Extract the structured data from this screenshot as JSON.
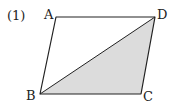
{
  "problem_label": "(1)",
  "figure": {
    "shape": "parallelogram",
    "vertices": {
      "A": {
        "label": "A",
        "x": 56,
        "y": 17
      },
      "B": {
        "label": "B",
        "x": 40,
        "y": 94
      },
      "C": {
        "label": "C",
        "x": 141,
        "y": 94
      },
      "D": {
        "label": "D",
        "x": 155,
        "y": 17
      }
    },
    "diagonal": "BD",
    "shaded_region": "triangle BCD",
    "colors": {
      "stroke": "#222222",
      "shade": "#dcdcdc"
    }
  }
}
